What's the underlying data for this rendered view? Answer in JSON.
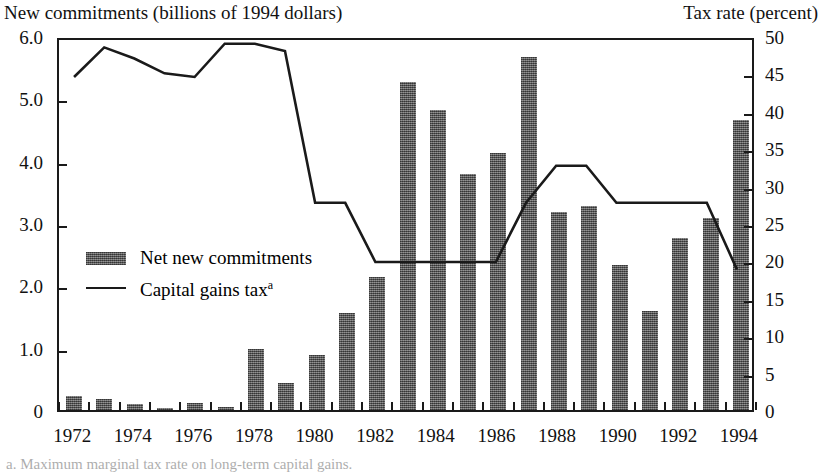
{
  "titles": {
    "left_axis": "New commitments (billions of 1994 dollars)",
    "right_axis": "Tax rate (percent)"
  },
  "legend": {
    "bar_label": "Net new commitments",
    "line_label": "Capital gains tax",
    "line_label_superscript": "a"
  },
  "footnote": {
    "text": "a. Maximum marginal tax rate on long-term capital gains."
  },
  "colors": {
    "bar_fill": "#5e5e5e",
    "line_stroke": "#1a1a1a",
    "axis": "#1a1a1a",
    "background": "#ffffff",
    "text": "#111111"
  },
  "chart_data": {
    "type": "bar",
    "title": "",
    "xlabel": "",
    "ylabel": "New commitments (billions of 1994 dollars)",
    "y2label": "Tax rate (percent)",
    "grid": false,
    "legend_position": "inside-left",
    "ylim": [
      0,
      6.0
    ],
    "y2lim": [
      0,
      50
    ],
    "yticks": [
      "0",
      "1.0",
      "2.0",
      "3.0",
      "4.0",
      "5.0",
      "6.0"
    ],
    "ytick_values": [
      0,
      1.0,
      2.0,
      3.0,
      4.0,
      5.0,
      6.0
    ],
    "y2ticks": [
      "0",
      "5",
      "10",
      "15",
      "20",
      "25",
      "30",
      "35",
      "40",
      "45",
      "50"
    ],
    "y2tick_values": [
      0,
      5,
      10,
      15,
      20,
      25,
      30,
      35,
      40,
      45,
      50
    ],
    "x": [
      1972,
      1973,
      1974,
      1975,
      1976,
      1977,
      1978,
      1979,
      1980,
      1981,
      1982,
      1983,
      1984,
      1985,
      1986,
      1987,
      1988,
      1989,
      1990,
      1991,
      1992,
      1993,
      1994
    ],
    "xtick_labels": [
      "1972",
      "1974",
      "1976",
      "1978",
      "1980",
      "1982",
      "1984",
      "1986",
      "1988",
      "1990",
      "1992",
      "1994"
    ],
    "xtick_values": [
      1972,
      1974,
      1976,
      1978,
      1980,
      1982,
      1984,
      1986,
      1988,
      1990,
      1992,
      1994
    ],
    "series": [
      {
        "name": "Net new commitments",
        "type": "bar",
        "axis": "left",
        "units": "billions of 1994 dollars",
        "values": [
          0.22,
          0.18,
          0.1,
          0.03,
          0.11,
          0.05,
          0.98,
          0.43,
          0.89,
          1.55,
          2.14,
          5.27,
          4.82,
          3.79,
          4.12,
          5.67,
          3.17,
          3.27,
          2.32,
          1.59,
          2.76,
          3.08,
          4.66
        ]
      },
      {
        "name": "Capital gains tax",
        "type": "line",
        "axis": "right",
        "units": "percent",
        "values": [
          45.0,
          49.0,
          47.5,
          45.5,
          45.0,
          49.5,
          49.5,
          48.5,
          28.0,
          28.0,
          20.0,
          20.0,
          20.0,
          20.0,
          20.0,
          28.0,
          33.0,
          33.0,
          28.0,
          28.0,
          28.0,
          28.0,
          19.0
        ]
      }
    ]
  }
}
